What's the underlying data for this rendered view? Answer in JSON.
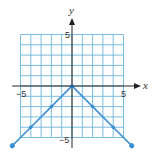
{
  "chart_data": {
    "type": "line",
    "title": "",
    "function": "y = -|x|",
    "xlabel": "x",
    "ylabel": "y",
    "xlim": [
      -5,
      5
    ],
    "ylim": [
      -5,
      5
    ],
    "grid": true,
    "x_ticks_labeled": [
      "-5",
      "5"
    ],
    "y_ticks_labeled": [
      "5",
      "-5"
    ],
    "series": [
      {
        "name": "y = -|x|",
        "x": [
          -5.8,
          -4,
          -2,
          0,
          2,
          4,
          5.8
        ],
        "y": [
          -5.8,
          -4,
          -2,
          0,
          -2,
          -4,
          -5.8
        ],
        "marked_points": [
          [
            -4,
            -4
          ],
          [
            -2,
            -2
          ],
          [
            0,
            0
          ],
          [
            2,
            -2
          ],
          [
            4,
            -4
          ]
        ],
        "arrows_at_ends": true
      }
    ],
    "colors": {
      "grid": "#6bb6dd",
      "line": "#3b8fd0",
      "axis": "#222222"
    }
  },
  "labels": {
    "x_axis": "x",
    "y_axis": "y",
    "x_min": "−5",
    "x_max": "5",
    "y_max": "5",
    "y_min": "−5"
  }
}
